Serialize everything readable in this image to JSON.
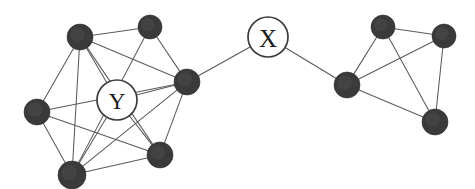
{
  "diagram": {
    "background_color": "#ffffff",
    "edge_color": "#5a5a5a",
    "filled_node_color": "#3a3a3a",
    "open_node_fill": "#ffffff",
    "open_node_stroke": "#3c3c3c",
    "label_color": "#1c1c1c",
    "width": 475,
    "height": 189
  },
  "labels": {
    "x_node": "X",
    "y_node": "Y"
  },
  "nodes": [
    {
      "id": "L1",
      "label": "",
      "type": "filled",
      "cluster": "left",
      "cx": 80,
      "cy": 37,
      "r": 13
    },
    {
      "id": "L2",
      "label": "",
      "type": "filled",
      "cluster": "left",
      "cx": 150,
      "cy": 27,
      "r": 12
    },
    {
      "id": "L3",
      "label": "",
      "type": "filled",
      "cluster": "left",
      "cx": 37,
      "cy": 112,
      "r": 13
    },
    {
      "id": "L4",
      "label": "",
      "type": "filled",
      "cluster": "left",
      "cx": 187,
      "cy": 82,
      "r": 13
    },
    {
      "id": "L5",
      "label": "",
      "type": "filled",
      "cluster": "left",
      "cx": 72,
      "cy": 175,
      "r": 14
    },
    {
      "id": "L6",
      "label": "",
      "type": "filled",
      "cluster": "left",
      "cx": 160,
      "cy": 155,
      "r": 13
    },
    {
      "id": "Y",
      "label": "Y",
      "type": "open",
      "cluster": "left",
      "cx": 117,
      "cy": 100,
      "r": 20
    },
    {
      "id": "X",
      "label": "X",
      "type": "open",
      "cluster": "bridge",
      "cx": 268,
      "cy": 37,
      "r": 20
    },
    {
      "id": "R1",
      "label": "",
      "type": "filled",
      "cluster": "right",
      "cx": 347,
      "cy": 85,
      "r": 13
    },
    {
      "id": "R2",
      "label": "",
      "type": "filled",
      "cluster": "right",
      "cx": 383,
      "cy": 27,
      "r": 12
    },
    {
      "id": "R3",
      "label": "",
      "type": "filled",
      "cluster": "right",
      "cx": 444,
      "cy": 36,
      "r": 12
    },
    {
      "id": "R4",
      "label": "",
      "type": "filled",
      "cluster": "right",
      "cx": 435,
      "cy": 122,
      "r": 13
    }
  ],
  "edges": [
    {
      "from": "L1",
      "to": "L2",
      "kind": "cluster"
    },
    {
      "from": "L1",
      "to": "L3",
      "kind": "cluster"
    },
    {
      "from": "L1",
      "to": "L4",
      "kind": "cluster"
    },
    {
      "from": "L1",
      "to": "L5",
      "kind": "cluster"
    },
    {
      "from": "L1",
      "to": "L6",
      "kind": "cluster"
    },
    {
      "from": "L1",
      "to": "Y",
      "kind": "cluster"
    },
    {
      "from": "L2",
      "to": "L5",
      "kind": "cluster"
    },
    {
      "from": "L2",
      "to": "L4",
      "kind": "cluster"
    },
    {
      "from": "L3",
      "to": "L4",
      "kind": "cluster"
    },
    {
      "from": "L3",
      "to": "L5",
      "kind": "cluster"
    },
    {
      "from": "L3",
      "to": "L6",
      "kind": "cluster"
    },
    {
      "from": "L4",
      "to": "L5",
      "kind": "cluster"
    },
    {
      "from": "L4",
      "to": "L6",
      "kind": "cluster"
    },
    {
      "from": "L4",
      "to": "Y",
      "kind": "cluster"
    },
    {
      "from": "L5",
      "to": "L6",
      "kind": "cluster"
    },
    {
      "from": "L5",
      "to": "Y",
      "kind": "cluster"
    },
    {
      "from": "L6",
      "to": "Y",
      "kind": "cluster"
    },
    {
      "from": "L4",
      "to": "X",
      "kind": "bridge"
    },
    {
      "from": "X",
      "to": "R1",
      "kind": "bridge"
    },
    {
      "from": "R1",
      "to": "R2",
      "kind": "cluster"
    },
    {
      "from": "R1",
      "to": "R3",
      "kind": "cluster"
    },
    {
      "from": "R1",
      "to": "R4",
      "kind": "cluster"
    },
    {
      "from": "R2",
      "to": "R3",
      "kind": "cluster"
    },
    {
      "from": "R2",
      "to": "R4",
      "kind": "cluster"
    },
    {
      "from": "R3",
      "to": "R4",
      "kind": "cluster"
    }
  ]
}
